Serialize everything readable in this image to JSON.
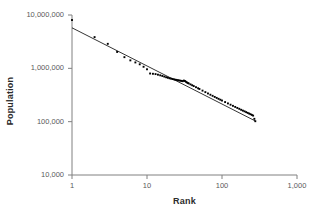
{
  "chart_data": {
    "type": "scatter",
    "title": "",
    "xlabel": "Rank",
    "ylabel": "Population",
    "xscale": "log",
    "yscale": "log",
    "xlim": [
      1,
      1000
    ],
    "ylim": [
      10000,
      10000000
    ],
    "grid": false,
    "legend": null,
    "xticks": [
      {
        "value": 1,
        "label": "1"
      },
      {
        "value": 10,
        "label": "10"
      },
      {
        "value": 100,
        "label": "100"
      },
      {
        "value": 1000,
        "label": "1,000"
      }
    ],
    "yticks": [
      {
        "value": 10000,
        "label": "10,000"
      },
      {
        "value": 100000,
        "label": "100,000"
      },
      {
        "value": 1000000,
        "label": "1,000,000"
      },
      {
        "value": 10000000,
        "label": "10,000,000"
      }
    ],
    "marker": "square",
    "marker_color": "#000000",
    "marker_size": 1.9,
    "series": [
      {
        "name": "Cities by rank",
        "points": [
          [
            1,
            8050000
          ],
          [
            2,
            3850000
          ],
          [
            3,
            2880000
          ],
          [
            4,
            2030000
          ],
          [
            5,
            1620000
          ],
          [
            6,
            1410000
          ],
          [
            7,
            1290000
          ],
          [
            8,
            1190000
          ],
          [
            9,
            1070000
          ],
          [
            10,
            960000
          ],
          [
            11,
            800000
          ],
          [
            12,
            790000
          ],
          [
            13,
            780000
          ],
          [
            14,
            760000
          ],
          [
            15,
            740000
          ],
          [
            16,
            720000
          ],
          [
            17,
            700000
          ],
          [
            18,
            680000
          ],
          [
            19,
            665000
          ],
          [
            20,
            650000
          ],
          [
            21,
            640000
          ],
          [
            22,
            630000
          ],
          [
            23,
            620000
          ],
          [
            24,
            612000
          ],
          [
            25,
            605000
          ],
          [
            26,
            598000
          ],
          [
            27,
            592000
          ],
          [
            28,
            586000
          ],
          [
            29,
            580000
          ],
          [
            30,
            575000
          ],
          [
            31,
            590000
          ],
          [
            32,
            580000
          ],
          [
            33,
            560000
          ],
          [
            34,
            545000
          ],
          [
            35,
            532000
          ],
          [
            36,
            520000
          ],
          [
            38,
            500000
          ],
          [
            40,
            482000
          ],
          [
            42,
            465000
          ],
          [
            45,
            443000
          ],
          [
            48,
            423000
          ],
          [
            50,
            410000
          ],
          [
            55,
            382000
          ],
          [
            60,
            358000
          ],
          [
            65,
            338000
          ],
          [
            70,
            320000
          ],
          [
            75,
            305000
          ],
          [
            80,
            291000
          ],
          [
            85,
            279000
          ],
          [
            90,
            268000
          ],
          [
            95,
            258000
          ],
          [
            100,
            249000
          ],
          [
            110,
            233000
          ],
          [
            120,
            220000
          ],
          [
            130,
            208000
          ],
          [
            140,
            198000
          ],
          [
            150,
            189000
          ],
          [
            160,
            181000
          ],
          [
            170,
            174000
          ],
          [
            180,
            167000
          ],
          [
            190,
            161000
          ],
          [
            200,
            156000
          ],
          [
            210,
            151000
          ],
          [
            220,
            146000
          ],
          [
            230,
            142000
          ],
          [
            240,
            138000
          ],
          [
            250,
            134000
          ],
          [
            260,
            130000
          ],
          [
            270,
            113000
          ],
          [
            278,
            102000
          ]
        ]
      }
    ],
    "trendline": {
      "name": "Zipf power-law fit",
      "color": "#000000",
      "width": 0.8,
      "start": [
        1,
        5750000
      ],
      "end": [
        278,
        103000
      ],
      "exponent": -0.72
    },
    "annotations": []
  }
}
